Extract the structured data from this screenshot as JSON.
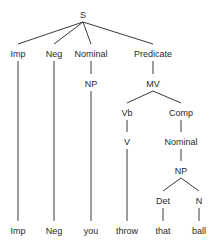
{
  "diagram": {
    "type": "syntax-tree",
    "nodes": [
      {
        "id": "S",
        "label": "S",
        "x": 83,
        "y": 15
      },
      {
        "id": "Imp",
        "label": "Imp",
        "x": 18,
        "y": 54
      },
      {
        "id": "Neg",
        "label": "Neg",
        "x": 54,
        "y": 54
      },
      {
        "id": "Nominal1",
        "label": "Nominal",
        "x": 91,
        "y": 54
      },
      {
        "id": "Predicate",
        "label": "Predicate",
        "x": 153,
        "y": 54
      },
      {
        "id": "NP1",
        "label": "NP",
        "x": 91,
        "y": 84
      },
      {
        "id": "MV",
        "label": "MV",
        "x": 153,
        "y": 84
      },
      {
        "id": "Vb",
        "label": "Vb",
        "x": 127,
        "y": 113
      },
      {
        "id": "Comp",
        "label": "Comp",
        "x": 181,
        "y": 113
      },
      {
        "id": "V",
        "label": "V",
        "x": 127,
        "y": 142
      },
      {
        "id": "Nominal2",
        "label": "Nominal",
        "x": 181,
        "y": 142
      },
      {
        "id": "NP2",
        "label": "NP",
        "x": 181,
        "y": 171
      },
      {
        "id": "Det",
        "label": "Det",
        "x": 163,
        "y": 201
      },
      {
        "id": "N",
        "label": "N",
        "x": 199,
        "y": 201
      },
      {
        "id": "leaf_imp",
        "label": "Imp",
        "x": 18,
        "y": 231
      },
      {
        "id": "leaf_neg",
        "label": "Neg",
        "x": 54,
        "y": 231
      },
      {
        "id": "leaf_you",
        "label": "you",
        "x": 91,
        "y": 231
      },
      {
        "id": "leaf_throw",
        "label": "throw",
        "x": 127,
        "y": 231
      },
      {
        "id": "leaf_that",
        "label": "that",
        "x": 163,
        "y": 231
      },
      {
        "id": "leaf_ball",
        "label": "ball",
        "x": 199,
        "y": 231
      }
    ],
    "edges": [
      [
        "S",
        "Imp"
      ],
      [
        "S",
        "Neg"
      ],
      [
        "S",
        "Nominal1"
      ],
      [
        "S",
        "Predicate"
      ],
      [
        "Imp",
        "leaf_imp"
      ],
      [
        "Neg",
        "leaf_neg"
      ],
      [
        "Nominal1",
        "NP1"
      ],
      [
        "NP1",
        "leaf_you"
      ],
      [
        "Predicate",
        "MV"
      ],
      [
        "MV",
        "Vb"
      ],
      [
        "MV",
        "Comp"
      ],
      [
        "Vb",
        "V"
      ],
      [
        "V",
        "leaf_throw"
      ],
      [
        "Comp",
        "Nominal2"
      ],
      [
        "Nominal2",
        "NP2"
      ],
      [
        "NP2",
        "Det"
      ],
      [
        "NP2",
        "N"
      ],
      [
        "Det",
        "leaf_that"
      ],
      [
        "N",
        "leaf_ball"
      ]
    ]
  }
}
